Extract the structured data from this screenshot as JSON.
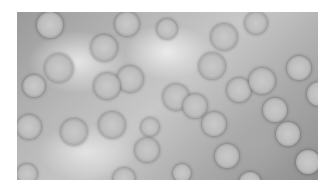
{
  "image": {
    "description": "Grayscale negative-stain electron micrograph showing many roughly spherical particles",
    "background_color": "#a8a8a8",
    "particle_color": "#c4c4c4",
    "rim_color": "#6e6e6e"
  },
  "particles": [
    {
      "x": 20,
      "y": 0,
      "r": 13
    },
    {
      "x": 98,
      "y": 0,
      "r": 12
    },
    {
      "x": 28,
      "y": 42,
      "r": 14
    },
    {
      "x": 74,
      "y": 23,
      "r": 13
    },
    {
      "x": 100,
      "y": 54,
      "r": 13
    },
    {
      "x": 77,
      "y": 61,
      "r": 13
    },
    {
      "x": 140,
      "y": 7,
      "r": 10
    },
    {
      "x": 194,
      "y": 12,
      "r": 13
    },
    {
      "x": 228,
      "y": 0,
      "r": 11
    },
    {
      "x": 182,
      "y": 41,
      "r": 13
    },
    {
      "x": 6,
      "y": 63,
      "r": 11
    },
    {
      "x": 146,
      "y": 72,
      "r": 13
    },
    {
      "x": 210,
      "y": 66,
      "r": 12
    },
    {
      "x": 232,
      "y": 56,
      "r": 13
    },
    {
      "x": 270,
      "y": 44,
      "r": 12
    },
    {
      "x": 290,
      "y": 70,
      "r": 12
    },
    {
      "x": 0,
      "y": 103,
      "r": 12
    },
    {
      "x": 44,
      "y": 107,
      "r": 13
    },
    {
      "x": 82,
      "y": 100,
      "r": 13
    },
    {
      "x": 124,
      "y": 106,
      "r": 9
    },
    {
      "x": 118,
      "y": 126,
      "r": 12
    },
    {
      "x": 166,
      "y": 82,
      "r": 12
    },
    {
      "x": 185,
      "y": 100,
      "r": 12
    },
    {
      "x": 198,
      "y": 132,
      "r": 12
    },
    {
      "x": 246,
      "y": 86,
      "r": 12
    },
    {
      "x": 259,
      "y": 110,
      "r": 12
    },
    {
      "x": 279,
      "y": 138,
      "r": 12
    },
    {
      "x": 0,
      "y": 152,
      "r": 10
    },
    {
      "x": 96,
      "y": 156,
      "r": 11
    },
    {
      "x": 156,
      "y": 152,
      "r": 9
    },
    {
      "x": 222,
      "y": 160,
      "r": 11
    }
  ]
}
